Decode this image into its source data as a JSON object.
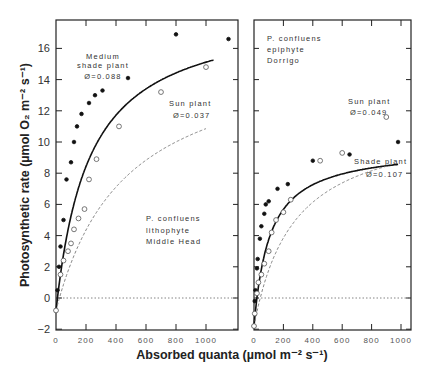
{
  "chart_data": [
    {
      "type": "scatter",
      "panel": "left",
      "xlabel": "Absorbed quanta (µmol m⁻² s⁻¹)",
      "ylabel": "Photosynthetic rate (µmol O₂ m⁻² s⁻¹)",
      "xlim": [
        0,
        1200
      ],
      "ylim": [
        -2,
        18
      ],
      "x_ticks": [
        0,
        200,
        400,
        600,
        800,
        1000
      ],
      "y_ticks": [
        -2,
        0,
        2,
        4,
        6,
        8,
        10,
        12,
        14,
        16
      ],
      "zero_line": true,
      "annotation": [
        "P. confluens",
        "lithophyte",
        "Middle Head"
      ],
      "series": [
        {
          "name": "Medium shade plant",
          "label_lines": [
            "Medium",
            "shade plant",
            "Ø=0.088"
          ],
          "phi": 0.088,
          "marker": "filled-circle",
          "line": "solid",
          "x": [
            0,
            10,
            20,
            30,
            50,
            70,
            100,
            120,
            140,
            170,
            220,
            260,
            310,
            480,
            800,
            1150
          ],
          "y": [
            -0.8,
            0.5,
            2.0,
            3.3,
            5.0,
            7.6,
            8.7,
            10.0,
            11.0,
            11.8,
            12.5,
            13.0,
            13.3,
            14.1,
            16.9,
            16.6
          ]
        },
        {
          "name": "Sun plant",
          "label_lines": [
            "Sun plant",
            "Ø=0.037"
          ],
          "phi": 0.037,
          "marker": "open-circle",
          "line": "dashed",
          "x": [
            0,
            30,
            50,
            80,
            100,
            120,
            150,
            190,
            220,
            270,
            420,
            700,
            1000
          ],
          "y": [
            -0.8,
            1.5,
            2.4,
            3.0,
            3.5,
            4.4,
            5.1,
            5.7,
            7.6,
            8.9,
            11.0,
            13.2,
            14.8
          ]
        }
      ]
    },
    {
      "type": "scatter",
      "panel": "right",
      "xlim": [
        0,
        1050
      ],
      "ylim": [
        -2,
        18
      ],
      "x_ticks": [
        0,
        200,
        400,
        600,
        800,
        1000
      ],
      "zero_line": true,
      "annotation": [
        "P. confluens",
        "epiphyte",
        "Dorrigo"
      ],
      "series": [
        {
          "name": "Shade plant",
          "label_lines": [
            "Shade plant",
            "Ø=0.107"
          ],
          "phi": 0.107,
          "marker": "filled-circle",
          "line": "solid",
          "x": [
            0,
            5,
            10,
            20,
            25,
            40,
            50,
            70,
            80,
            100,
            160,
            230,
            400,
            650,
            980
          ],
          "y": [
            -1.8,
            -0.2,
            0.5,
            1.9,
            2.5,
            3.8,
            4.6,
            5.4,
            6.0,
            6.2,
            7.0,
            7.3,
            8.8,
            9.2,
            10.0
          ]
        },
        {
          "name": "Sun plant",
          "label_lines": [
            "Sun plant",
            "Ø=0.049"
          ],
          "phi": 0.049,
          "marker": "open-circle",
          "line": "dashed",
          "x": [
            0,
            5,
            20,
            30,
            50,
            70,
            100,
            120,
            150,
            200,
            250,
            450,
            600,
            900
          ],
          "y": [
            -1.8,
            -1.0,
            0.3,
            1.0,
            1.5,
            2.2,
            3.0,
            4.2,
            5.0,
            5.5,
            6.3,
            8.8,
            9.3,
            11.6
          ]
        }
      ]
    }
  ],
  "labels": {
    "ylabel": "Photosynthetic rate (µmol O₂ m⁻² s⁻¹)",
    "xlabel": "Absorbed quanta (µmol m⁻² s⁻¹)",
    "left_shade_l1": "Medium",
    "left_shade_l2": "shade plant",
    "left_shade_l3": "Ø=0.088",
    "left_sun_l1": "Sun plant",
    "left_sun_l2": "Ø=0.037",
    "left_site_l1": "P. confluens",
    "left_site_l2": "lithophyte",
    "left_site_l3": "Middle Head",
    "right_site_l1": "P. confluens",
    "right_site_l2": "epiphyte",
    "right_site_l3": "Dorrigo",
    "right_sun_l1": "Sun plant",
    "right_sun_l2": "Ø=0.049",
    "right_shade_l1": "Shade plant",
    "right_shade_l2": "Ø=0.107"
  }
}
